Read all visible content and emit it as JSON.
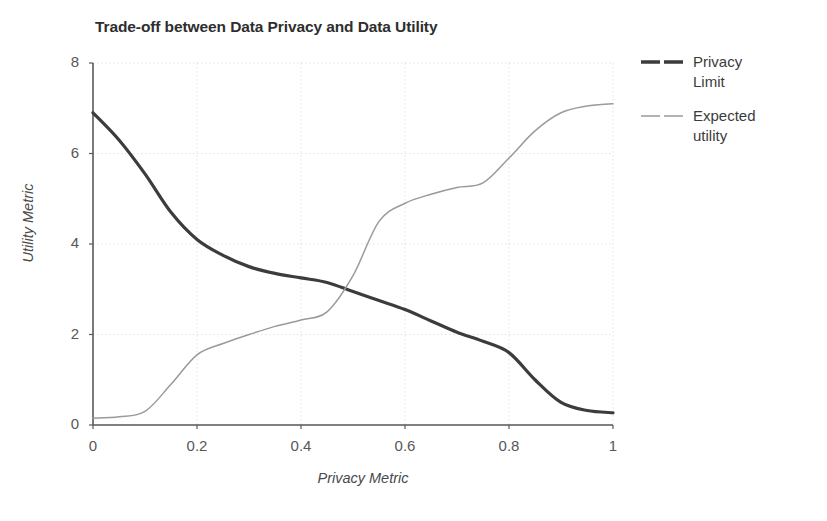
{
  "chart_data": {
    "type": "line",
    "title": "Trade-off between Data Privacy and Data Utility",
    "xlabel": "Privacy Metric",
    "ylabel": "Utility Metric",
    "xlim": [
      0,
      1
    ],
    "ylim": [
      0,
      8
    ],
    "xticks": [
      "0",
      "0.2",
      "0.4",
      "0.6",
      "0.8",
      "1"
    ],
    "xtick_values": [
      0,
      0.2,
      0.4,
      0.6,
      0.8,
      1
    ],
    "yticks": [
      "0",
      "2",
      "4",
      "6",
      "8"
    ],
    "ytick_values": [
      0,
      2,
      4,
      6,
      8
    ],
    "grid": true,
    "grid_color": "#d9d9d9",
    "legend_position": "right",
    "background": "#ffffff",
    "axis_color": "#595959",
    "x": [
      0,
      0.05,
      0.1,
      0.15,
      0.2,
      0.25,
      0.3,
      0.35,
      0.4,
      0.45,
      0.5,
      0.55,
      0.6,
      0.65,
      0.7,
      0.75,
      0.8,
      0.85,
      0.9,
      0.95,
      1
    ],
    "series": [
      {
        "name": "Privacy Limit",
        "label": "Privacy\nLimit",
        "color": "#3c3c3c",
        "width": 3.2,
        "values": [
          6.9,
          6.3,
          5.55,
          4.7,
          4.1,
          3.75,
          3.5,
          3.35,
          3.25,
          3.15,
          2.95,
          2.75,
          2.55,
          2.3,
          2.05,
          1.85,
          1.6,
          1.0,
          0.5,
          0.32,
          0.27
        ]
      },
      {
        "name": "Expected utility",
        "label": "Expected\nutility",
        "color": "#9a9a9a",
        "width": 1.5,
        "values": [
          0.15,
          0.18,
          0.3,
          0.9,
          1.55,
          1.8,
          2.0,
          2.18,
          2.32,
          2.5,
          3.3,
          4.5,
          4.9,
          5.1,
          5.25,
          5.35,
          5.9,
          6.5,
          6.9,
          7.05,
          7.1
        ]
      }
    ],
    "annotations": {
      "crossover_x": 0.47,
      "crossover_y": 3.1
    }
  },
  "legend": {
    "items": [
      {
        "label": "Privacy\nLimit",
        "color": "#3c3c3c",
        "style": "thick-dash"
      },
      {
        "label": "Expected\nutility",
        "color": "#9a9a9a",
        "style": "thin-dash"
      }
    ]
  }
}
